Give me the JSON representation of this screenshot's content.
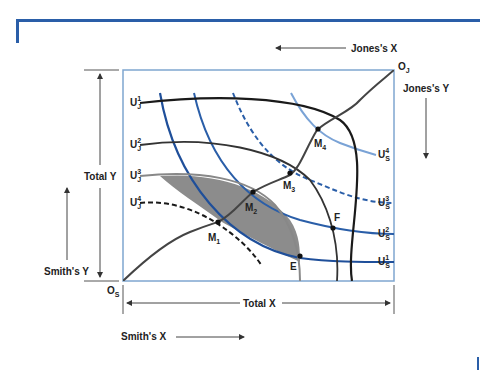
{
  "diagram": {
    "type": "edgeworth-box",
    "origins": {
      "smith": "O",
      "smith_sub": "S",
      "jones": "O",
      "jones_sub": "J"
    },
    "axis_labels": {
      "jones_x": "Jones's X",
      "jones_y": "Jones's Y",
      "total_y": "Total Y",
      "smiths_y": "Smith's Y",
      "total_x": "Total X",
      "smiths_x": "Smith's X"
    },
    "jones_indifference_curves": [
      {
        "base": "U",
        "sup": "1",
        "sub": "J",
        "style": "solid",
        "color": "#1a1a1a"
      },
      {
        "base": "U",
        "sup": "2",
        "sub": "J",
        "style": "solid",
        "color": "#333333"
      },
      {
        "base": "U",
        "sup": "3",
        "sub": "J",
        "style": "solid",
        "color": "#888888"
      },
      {
        "base": "U",
        "sup": "4",
        "sub": "J",
        "style": "dashed",
        "color": "#1a1a1a"
      }
    ],
    "smith_indifference_curves": [
      {
        "base": "U",
        "sup": "4",
        "sub": "S",
        "style": "solid",
        "color": "#7aa3d6"
      },
      {
        "base": "U",
        "sup": "3",
        "sub": "S",
        "style": "dashed",
        "color": "#2a5ea8"
      },
      {
        "base": "U",
        "sup": "2",
        "sub": "S",
        "style": "solid",
        "color": "#2a5ea8"
      },
      {
        "base": "U",
        "sup": "1",
        "sub": "S",
        "style": "solid",
        "color": "#1f4f9a"
      }
    ],
    "points": [
      {
        "base": "M",
        "sub": "1"
      },
      {
        "base": "M",
        "sub": "2"
      },
      {
        "base": "M",
        "sub": "3"
      },
      {
        "base": "M",
        "sub": "4"
      },
      {
        "base": "E",
        "sub": ""
      },
      {
        "base": "F",
        "sub": ""
      }
    ],
    "contract_curve": "O_S to O_J through M1, M2, M3, M4",
    "shaded_region": "lens between U_J^3 and U_S^1 (mutually beneficial trades)",
    "colors": {
      "frame": "#7fa6d0",
      "accent": "#2a5ea8",
      "shade": "#8c8c8c"
    }
  }
}
